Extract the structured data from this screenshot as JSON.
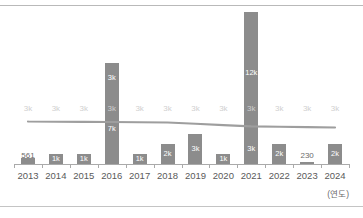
{
  "chart_data": {
    "type": "bar",
    "title": "",
    "subtitle": "",
    "xlabel": "(연도)",
    "ylabel": "",
    "grid": false,
    "legend_position": "none",
    "axis_note": "(연도)",
    "categories": [
      "2013",
      "2014",
      "2015",
      "2016",
      "2017",
      "2018",
      "2019",
      "2020",
      "2021",
      "2022",
      "2023",
      "2024"
    ],
    "ylim": [
      0,
      15000
    ],
    "series": [
      {
        "name": "bar-lower",
        "type": "bar",
        "values": [
          561,
          1000,
          1000,
          7000,
          1000,
          2000,
          3000,
          1000,
          3000,
          2000,
          230,
          2000
        ],
        "labels": [
          "561",
          "1k",
          "1k",
          "7k",
          "1k",
          "2k",
          "3k",
          "1k",
          "3k",
          "2k",
          "230",
          "2k"
        ],
        "label_inside": [
          false,
          true,
          true,
          true,
          true,
          true,
          true,
          true,
          true,
          true,
          false,
          true
        ]
      },
      {
        "name": "bar-upper",
        "type": "bar",
        "values": [
          0,
          0,
          0,
          3000,
          0,
          0,
          0,
          0,
          12000,
          0,
          0,
          0
        ],
        "labels": [
          "",
          "",
          "",
          "3k",
          "",
          "",
          "",
          "",
          "12k",
          "",
          "",
          ""
        ],
        "label_inside": [
          false,
          false,
          false,
          false,
          false,
          false,
          false,
          false,
          true,
          false,
          false,
          false
        ]
      },
      {
        "name": "trend-line",
        "type": "line",
        "values": [
          3000,
          3000,
          3000,
          3000,
          3000,
          3000,
          3000,
          3000,
          3000,
          3000,
          3000,
          3000
        ],
        "labels": [
          "3k",
          "3k",
          "3k",
          "3k",
          "3k",
          "3k",
          "3k",
          "3k",
          "3k",
          "3k",
          "3k",
          "3k"
        ]
      }
    ],
    "colors": {
      "bar": "#8c8c8c",
      "line": "#9e9e9e",
      "line_label": "#cfcfcf",
      "bar_label_inside": "#ffffff",
      "bar_label_outside": "#6b6b6b",
      "axis": "#aaaaaa",
      "category_label": "#5a5a5a",
      "rule": "#b9b9b9",
      "background": "#ffffff"
    }
  }
}
